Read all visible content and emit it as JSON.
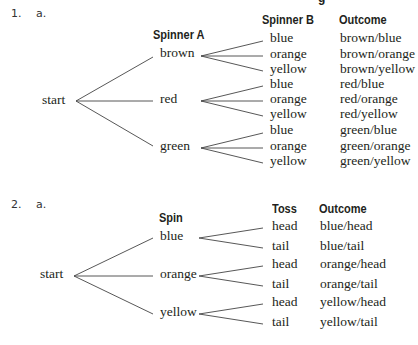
{
  "cutoff_heading": "g",
  "problems": [
    {
      "number": "1.",
      "part": "a.",
      "root": "start",
      "headers": {
        "level1": "Spinner A",
        "level2": "Spinner B",
        "outcome": "Outcome"
      },
      "level1": [
        "brown",
        "red",
        "green"
      ],
      "level2": [
        "blue",
        "orange",
        "yellow",
        "blue",
        "orange",
        "yellow",
        "blue",
        "orange",
        "yellow"
      ],
      "outcomes": [
        "brown/blue",
        "brown/orange",
        "brown/yellow",
        "red/blue",
        "red/orange",
        "red/yellow",
        "green/blue",
        "green/orange",
        "green/yellow"
      ]
    },
    {
      "number": "2.",
      "part": "a.",
      "root": "start",
      "headers": {
        "level1": "Spin",
        "level2": "Toss",
        "outcome": "Outcome"
      },
      "level1": [
        "blue",
        "orange",
        "yellow"
      ],
      "level2": [
        "head",
        "tail",
        "head",
        "tail",
        "head",
        "tail"
      ],
      "outcomes": [
        "blue/head",
        "blue/tail",
        "orange/head",
        "orange/tail",
        "yellow/head",
        "yellow/tail"
      ]
    }
  ]
}
